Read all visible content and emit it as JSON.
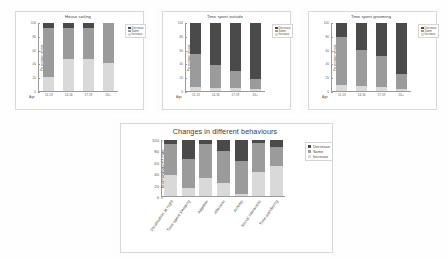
{
  "figure": {
    "background": "#fefefe",
    "axis_ylabel": "Percentage of cats",
    "axis_xlabel": "Age",
    "yticks": [
      "0",
      "20",
      "40",
      "60",
      "80",
      "100"
    ],
    "colors": {
      "decrease": "#4a4a4a",
      "same": "#9b9b9b",
      "increase": "#d9d9d9"
    },
    "legend": {
      "decrease": "Decrease",
      "same": "Same",
      "increase": "Increase"
    }
  },
  "chart_data": [
    {
      "type": "bar",
      "id": "house-soiling",
      "title": "House soiling",
      "xlabel": "Age",
      "ylabel": "Percentage of cats",
      "ylim": [
        0,
        100
      ],
      "yticks": [
        0,
        20,
        40,
        60,
        80,
        100
      ],
      "grid": false,
      "stacked": true,
      "legend_position": "top-right",
      "categories": [
        "11-13",
        "14-16",
        "17-19",
        "20+"
      ],
      "series": [
        {
          "name": "Increase",
          "values": [
            21,
            47,
            47,
            41
          ]
        },
        {
          "name": "Same",
          "values": [
            72,
            46,
            46,
            59
          ]
        },
        {
          "name": "Decrease",
          "values": [
            7,
            7,
            7,
            0
          ]
        }
      ]
    },
    {
      "type": "bar",
      "id": "time-spent-outside",
      "title": "Time spent outside",
      "xlabel": "Age",
      "ylabel": "Percentage of cats",
      "ylim": [
        0,
        100
      ],
      "yticks": [
        0,
        20,
        40,
        60,
        80,
        100
      ],
      "grid": false,
      "stacked": true,
      "legend_position": "top-right",
      "categories": [
        "11-13",
        "14-16",
        "17-19",
        "20+"
      ],
      "series": [
        {
          "name": "Increase",
          "values": [
            6,
            4,
            4,
            3
          ]
        },
        {
          "name": "Same",
          "values": [
            49,
            34,
            25,
            14
          ]
        },
        {
          "name": "Decrease",
          "values": [
            45,
            62,
            71,
            83
          ]
        }
      ]
    },
    {
      "type": "bar",
      "id": "time-spent-grooming",
      "title": "Time spent grooming",
      "xlabel": "Age",
      "ylabel": "Percentage of cats",
      "ylim": [
        0,
        100
      ],
      "yticks": [
        0,
        20,
        40,
        60,
        80,
        100
      ],
      "grid": false,
      "stacked": true,
      "legend_position": "top-right",
      "categories": [
        "11-13",
        "14-16",
        "17-19",
        "20+"
      ],
      "series": [
        {
          "name": "Increase",
          "values": [
            9,
            7,
            6,
            3
          ]
        },
        {
          "name": "Same",
          "values": [
            71,
            54,
            45,
            22
          ]
        },
        {
          "name": "Decrease",
          "values": [
            20,
            39,
            49,
            75
          ]
        }
      ]
    },
    {
      "type": "bar",
      "id": "changes-in-different-behaviours",
      "title": "Changes in different behaviours",
      "xlabel": "",
      "ylabel": "Percentage of cats",
      "ylim": [
        0,
        100
      ],
      "yticks": [
        0,
        20,
        40,
        60,
        80,
        100
      ],
      "grid": false,
      "stacked": true,
      "legend_position": "top-right",
      "categories": [
        "Vocalisation at night",
        "Time spent sleeping",
        "Appetite",
        "Affection",
        "Anxiety",
        "Social interaction",
        "Time wandering"
      ],
      "series": [
        {
          "name": "Increase",
          "values": [
            37,
            14,
            33,
            23,
            4,
            42,
            53
          ]
        },
        {
          "name": "Same",
          "values": [
            56,
            53,
            60,
            58,
            58,
            52,
            34
          ]
        },
        {
          "name": "Decrease",
          "values": [
            7,
            33,
            7,
            19,
            38,
            6,
            13
          ]
        }
      ]
    }
  ]
}
